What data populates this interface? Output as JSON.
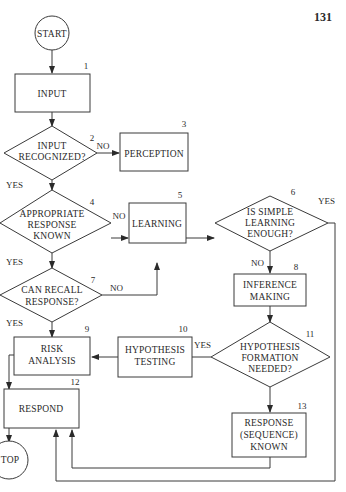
{
  "page": {
    "number": "131"
  },
  "nodes": {
    "start": {
      "label": "START"
    },
    "n1": {
      "num": "1",
      "lines": [
        "INPUT"
      ]
    },
    "n2": {
      "num": "2",
      "lines": [
        "INPUT",
        "RECOGNIZED?"
      ]
    },
    "n3": {
      "num": "3",
      "lines": [
        "PERCEPTION"
      ]
    },
    "n4": {
      "num": "4",
      "lines": [
        "APPROPRIATE",
        "RESPONSE",
        "KNOWN"
      ]
    },
    "n5": {
      "num": "5",
      "lines": [
        "LEARNING"
      ]
    },
    "n6": {
      "num": "6",
      "lines": [
        "IS SIMPLE",
        "LEARNING",
        "ENOUGH?"
      ]
    },
    "n7": {
      "num": "7",
      "lines": [
        "CAN RECALL",
        "RESPONSE?"
      ]
    },
    "n8": {
      "num": "8",
      "lines": [
        "INFERENCE",
        "MAKING"
      ]
    },
    "n9": {
      "num": "9",
      "lines": [
        "RISK",
        "ANALYSIS"
      ]
    },
    "n10": {
      "num": "10",
      "lines": [
        "HYPOTHESIS",
        "TESTING"
      ]
    },
    "n11": {
      "num": "11",
      "lines": [
        "HYPOTHESIS",
        "FORMATION",
        "NEEDED?"
      ]
    },
    "n12": {
      "num": "12",
      "lines": [
        "RESPOND"
      ]
    },
    "n13": {
      "num": "13",
      "lines": [
        "RESPONSE",
        "(SEQUENCE)",
        "KNOWN"
      ]
    },
    "top": {
      "label": "TOP"
    }
  },
  "edges": {
    "n2_no": "NO",
    "n2_yes": "YES",
    "n4_no": "NO",
    "n4_yes": "YES",
    "n6_yes": "YES",
    "n6_no": "NO",
    "n7_no": "NO",
    "n7_yes": "YES",
    "n11_yes": "YES"
  }
}
